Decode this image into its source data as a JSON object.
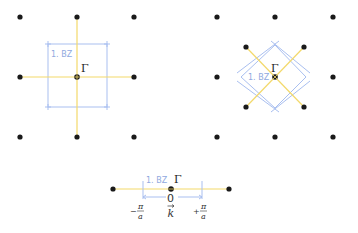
{
  "colors": {
    "dot": "#1a1a1a",
    "reciprocal_vector": "#f3d96a",
    "brillouin_zone": "#a9bff0",
    "label_bz": "#8fa9e0"
  },
  "panels": {
    "square_lattice": {
      "bz_label": "1. BZ",
      "center_label": "Γ"
    },
    "rotated_lattice": {
      "bz_label": "1. BZ",
      "center_label": "Γ"
    },
    "one_d_lattice": {
      "bz_label": "1. BZ",
      "center_label": "Γ",
      "origin_label": "0",
      "k_label": "k",
      "left_bound_sign": "−",
      "right_bound_sign": "+",
      "pi": "π",
      "a": "a"
    }
  }
}
